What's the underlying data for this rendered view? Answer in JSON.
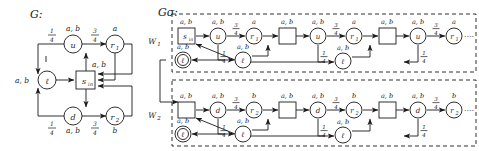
{
  "figure": {
    "type": "diagram",
    "left_title": "G:",
    "right_title": "Gσ:"
  },
  "symbols": {
    "alphabet_ab": "a, b",
    "letter_a": "a",
    "letter_b": "b",
    "prob_quarter_num": "1",
    "prob_quarter_den": "4",
    "prob_threequarter_num": "3",
    "prob_threequarter_den": "4",
    "ellipsis": "····"
  },
  "left_graph": {
    "title": "G:",
    "nodes": [
      {
        "id": "u",
        "label": "u",
        "shape": "circle",
        "toplabel": "a, b"
      },
      {
        "id": "r1",
        "label": "r",
        "sub": "1",
        "shape": "circle",
        "toplabel": "a"
      },
      {
        "id": "l",
        "label": "ℓ",
        "shape": "circle",
        "sidelabel": "a, b"
      },
      {
        "id": "sin",
        "label": "s",
        "sub": "in",
        "shape": "square",
        "toplabel": "a, b"
      },
      {
        "id": "d",
        "label": "d",
        "shape": "circle",
        "botlabel": "a, b"
      },
      {
        "id": "r2",
        "label": "r",
        "sub": "2",
        "shape": "circle",
        "botlabel": "b"
      }
    ],
    "edge_labels": {
      "u_to_l": {
        "num": "1",
        "den": "4"
      },
      "u_to_r1": {
        "num": "3",
        "den": "4"
      },
      "d_to_l": {
        "num": "1",
        "den": "4"
      },
      "d_to_r2": {
        "num": "3",
        "den": "4"
      }
    }
  },
  "right_graph": {
    "title": "Gσ:",
    "rows": [
      {
        "name": "W₁",
        "label": "W",
        "sub": "1",
        "chain": [
          {
            "id": "sin",
            "label": "s",
            "sub": "in",
            "shape": "square",
            "toplabel": "a, b"
          },
          {
            "id": "u1",
            "label": "u",
            "shape": "circle",
            "toplabel": "a, b"
          },
          {
            "id": "r1a",
            "label": "r",
            "sub": "1",
            "shape": "circle",
            "toplabel": "a"
          },
          {
            "id": "sq2",
            "label": "",
            "shape": "square",
            "toplabel": "a, b"
          },
          {
            "id": "u2",
            "label": "u",
            "shape": "circle",
            "toplabel": "a, b"
          },
          {
            "id": "r1b",
            "label": "r",
            "sub": "1",
            "shape": "circle",
            "toplabel": "a"
          },
          {
            "id": "sq3",
            "label": "",
            "shape": "square",
            "toplabel": "a, b"
          },
          {
            "id": "u3",
            "label": "u",
            "shape": "circle",
            "toplabel": "a, b"
          },
          {
            "id": "r1c",
            "label": "r",
            "sub": "1",
            "shape": "circle",
            "toplabel": "a"
          }
        ],
        "sink": {
          "id": "sinkW1",
          "label": "ℓ",
          "shape": "double-circle",
          "toplabel": "a, b"
        },
        "lower_nodes": [
          {
            "id": "l1",
            "label": "ℓ",
            "shape": "circle",
            "toplabel": "a, b"
          },
          {
            "id": "l2",
            "label": "ℓ",
            "shape": "circle",
            "toplabel": "a, b"
          }
        ],
        "probs": {
          "to_r1": {
            "num": "3",
            "den": "4"
          },
          "to_l": {
            "num": "1",
            "den": "4"
          }
        },
        "ellipsis": "····"
      },
      {
        "name": "W₂",
        "label": "W",
        "sub": "2",
        "chain": [
          {
            "id": "sq1b",
            "label": "",
            "shape": "square",
            "toplabel": "a, b"
          },
          {
            "id": "d1",
            "label": "d",
            "shape": "circle",
            "toplabel": "a, b"
          },
          {
            "id": "r2a",
            "label": "r",
            "sub": "2",
            "shape": "circle",
            "toplabel": "b"
          },
          {
            "id": "sq2b",
            "label": "",
            "shape": "square",
            "toplabel": "a, b"
          },
          {
            "id": "d2",
            "label": "d",
            "shape": "circle",
            "toplabel": "a, b"
          },
          {
            "id": "r2b",
            "label": "r",
            "sub": "2",
            "shape": "circle",
            "toplabel": "b"
          },
          {
            "id": "sq3b",
            "label": "",
            "shape": "square",
            "toplabel": "a, b"
          },
          {
            "id": "d3",
            "label": "d",
            "shape": "circle",
            "toplabel": "a, b"
          },
          {
            "id": "r2c",
            "label": "r",
            "sub": "2",
            "shape": "circle",
            "toplabel": "b"
          }
        ],
        "sink": {
          "id": "sinkW2",
          "label": "ℓ",
          "shape": "double-circle",
          "toplabel": "a, b"
        },
        "lower_nodes": [
          {
            "id": "l3",
            "label": "ℓ",
            "shape": "circle",
            "toplabel": "a, b"
          },
          {
            "id": "l4",
            "label": "ℓ",
            "shape": "circle",
            "toplabel": "a, b"
          }
        ],
        "probs": {
          "to_r2": {
            "num": "3",
            "den": "4"
          },
          "to_l": {
            "num": "1",
            "den": "4"
          }
        },
        "ellipsis": "····"
      }
    ]
  },
  "colors": {
    "ink": "#1a1a1a",
    "paper": "#ffffff"
  }
}
